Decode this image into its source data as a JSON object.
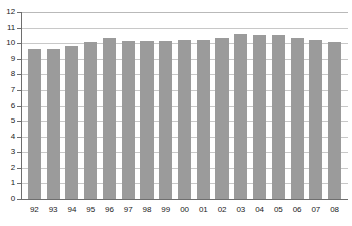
{
  "chart_data": {
    "type": "bar",
    "title": "",
    "subtitle": "",
    "xlabel": "",
    "ylabel": "",
    "categories": [
      "92",
      "93",
      "94",
      "95",
      "96",
      "97",
      "98",
      "99",
      "00",
      "01",
      "02",
      "03",
      "04",
      "05",
      "06",
      "07",
      "08"
    ],
    "values": [
      9.6,
      9.6,
      9.8,
      10.1,
      10.35,
      10.15,
      10.15,
      10.15,
      10.2,
      10.2,
      10.35,
      10.6,
      10.5,
      10.55,
      10.35,
      10.2,
      10.05
    ],
    "series": [
      {
        "name": "",
        "values": [
          9.6,
          9.6,
          9.8,
          10.1,
          10.35,
          10.15,
          10.15,
          10.15,
          10.2,
          10.2,
          10.35,
          10.6,
          10.5,
          10.55,
          10.35,
          10.2,
          10.05
        ]
      }
    ],
    "ylim": [
      0,
      12
    ],
    "yticks": [
      0,
      1,
      2,
      3,
      4,
      5,
      6,
      7,
      8,
      9,
      10,
      11,
      12
    ],
    "ytick_labels": [
      "0",
      "1",
      "2",
      "3",
      "4",
      "5",
      "6",
      "7",
      "8",
      "9",
      "10",
      "11",
      "12"
    ],
    "grid": true,
    "grid_axis": "y",
    "legend": false,
    "legend_position": "none",
    "bar_color": "#9b9b9b",
    "grid_color": "#c8c8c8",
    "axis_color": "#6e6e6e",
    "background_color": "#ffffff",
    "text_color": "#1a1a1a"
  }
}
